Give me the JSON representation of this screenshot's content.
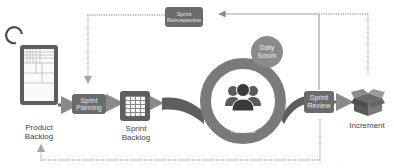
{
  "diagram": {
    "nodes": {
      "product_backlog": {
        "label_line1": "Product",
        "label_line2": "Backlog"
      },
      "sprint_planning": {
        "label_line1": "Sprint",
        "label_line2": "Planning"
      },
      "sprint_backlog": {
        "label_line1": "Sprint",
        "label_line2": "Backlog"
      },
      "daily_scrum": {
        "label_line1": "Daily",
        "label_line2": "Scrum"
      },
      "scrum_team": {
        "label": "7 Scrum Team",
        "icon": "team-icon"
      },
      "sprint_review": {
        "label_line1": "Sprint",
        "label_line2": "Review"
      },
      "sprint_retrospective": {
        "label_line1": "Sprint",
        "label_line2": "Retrospective"
      },
      "increment": {
        "label": "Increment",
        "icon": "box-icon"
      }
    },
    "edges": [
      {
        "from": "Product Backlog",
        "to": "Sprint Planning",
        "style": "solid"
      },
      {
        "from": "Sprint Planning",
        "to": "Sprint Backlog",
        "style": "solid"
      },
      {
        "from": "Sprint Backlog",
        "to": "Scrum Team",
        "style": "curved"
      },
      {
        "from": "Scrum Team",
        "to": "Sprint Review",
        "style": "curved"
      },
      {
        "from": "Sprint Review",
        "to": "Increment",
        "style": "solid"
      },
      {
        "from": "Sprint Review",
        "to": "Sprint Retrospective",
        "style": "solid"
      },
      {
        "from": "Sprint Retrospective",
        "to": "Sprint Planning",
        "style": "dotted"
      },
      {
        "from": "Increment",
        "to": "Sprint Retrospective",
        "style": "dotted"
      },
      {
        "from": "Sprint Review",
        "to": "Product Backlog",
        "style": "dotted"
      }
    ],
    "footer_text": "..."
  },
  "colors": {
    "primary_gray": "#6b6b6b",
    "dark_gray": "#5e5e5e",
    "line_gray": "#9a9a9a",
    "text": "#444444",
    "background": "#ffffff"
  }
}
